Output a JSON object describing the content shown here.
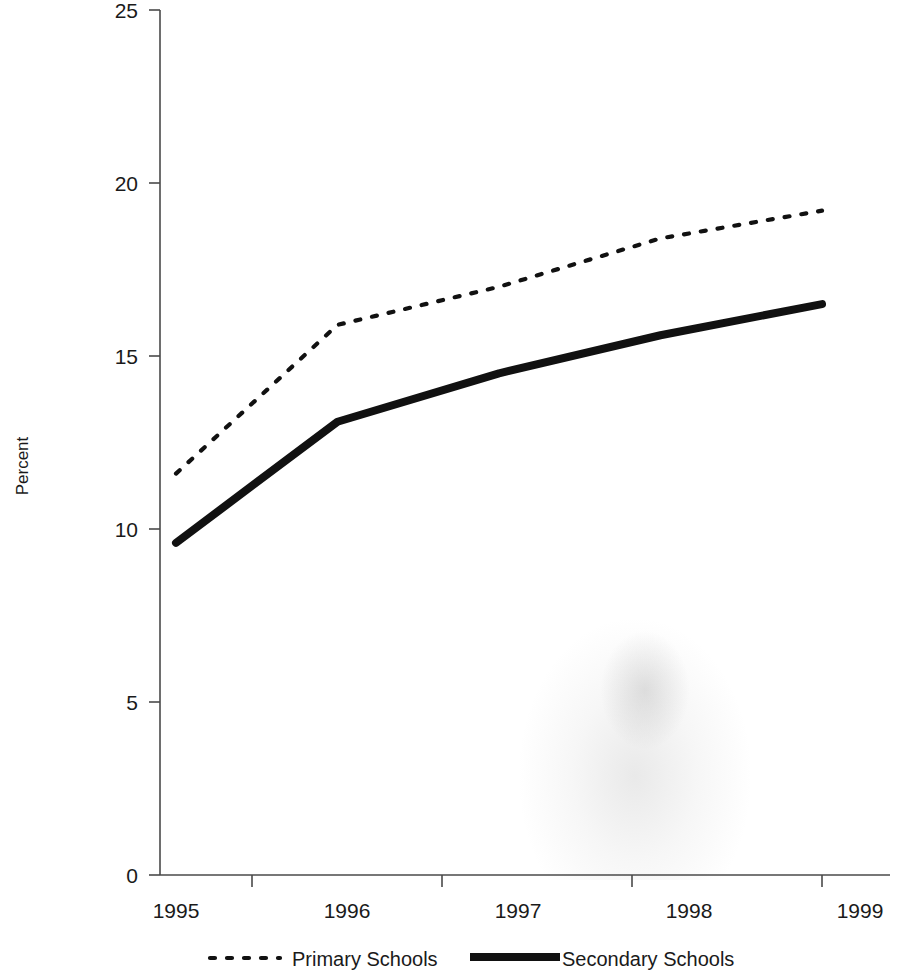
{
  "chart_data": {
    "type": "line",
    "title": "",
    "subtitle": "",
    "xlabel": "",
    "ylabel": "Percent",
    "categories": [
      "1995",
      "1996",
      "1997",
      "1998",
      "1999"
    ],
    "x": [
      1995,
      1996,
      1997,
      1998,
      1999
    ],
    "xlim": [
      1995,
      1999
    ],
    "ylim": [
      0,
      25
    ],
    "ytick_values": [
      0,
      5,
      10,
      15,
      20,
      25
    ],
    "ytick_labels": [
      "0",
      "5",
      "10",
      "15",
      "20",
      "25"
    ],
    "xtick_labels": [
      "1995",
      "1996",
      "1997",
      "1998",
      "1999"
    ],
    "grid": false,
    "legend_position": "bottom",
    "series": [
      {
        "name": "Primary Schools",
        "style": "dotted",
        "color": "#111111",
        "values": [
          11.6,
          15.9,
          17.0,
          18.4,
          19.2
        ]
      },
      {
        "name": "Secondary Schools",
        "style": "solid-thick",
        "color": "#111111",
        "values": [
          9.6,
          13.1,
          14.5,
          15.6,
          16.5
        ]
      }
    ]
  },
  "legend": {
    "items": [
      {
        "label": "Primary Schools",
        "marker": "dotted-line-icon"
      },
      {
        "label": "Secondary Schools",
        "marker": "solid-line-icon"
      }
    ]
  },
  "axes": {
    "y_title": "Percent"
  }
}
